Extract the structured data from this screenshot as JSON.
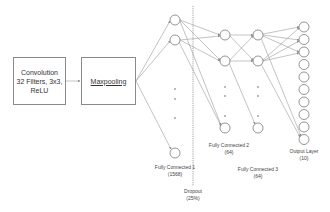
{
  "conv_box": {
    "line1": "Convolution",
    "line2": "32 Filters, 3x3,",
    "line3": "ReLU"
  },
  "maxpool_box": {
    "label": "Maxpooling"
  },
  "layers": {
    "fc1": {
      "name": "Fully Connected 1",
      "size": "(1568)"
    },
    "fc2": {
      "name": "Fully Connected 2",
      "size": "(64)"
    },
    "fc3": {
      "name": "Fully Connected 3",
      "size": "(64)"
    },
    "output": {
      "name": "Output Layer",
      "size": "(10)"
    },
    "dropout": {
      "name": "Dropout",
      "size": "(25%)"
    }
  },
  "colors": {
    "line": "#8a8a8a",
    "node": "#7a7a7a",
    "dot": "#999999"
  }
}
